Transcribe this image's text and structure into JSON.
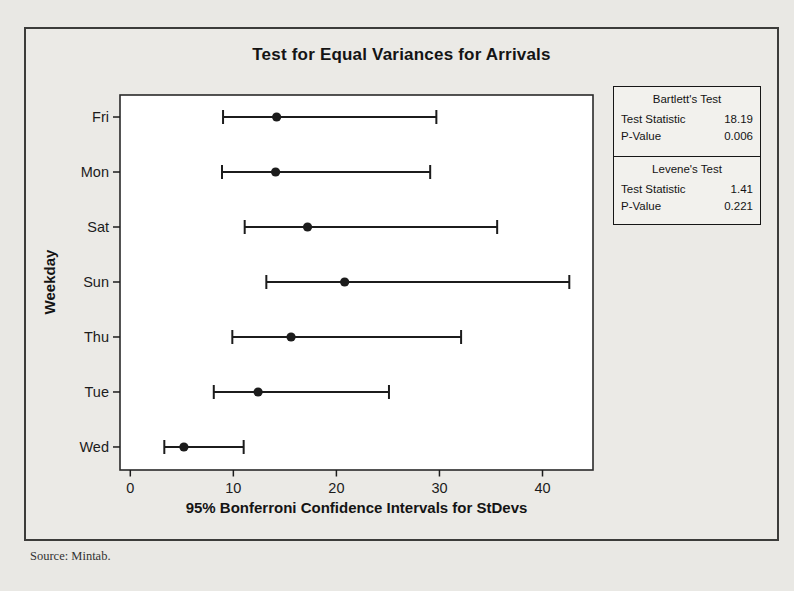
{
  "page": {
    "source_note": "Source: Mintab."
  },
  "chart_data": {
    "type": "scatter",
    "variant": "horizontal-confidence-interval-plot",
    "title": "Test for Equal Variances for Arrivals",
    "xlabel": "95% Bonferroni Confidence Intervals for StDevs",
    "ylabel": "Weekday",
    "categories": [
      "Fri",
      "Mon",
      "Sat",
      "Sun",
      "Thu",
      "Tue",
      "Wed"
    ],
    "series": [
      {
        "name": "95% Bonferroni CI for StDev",
        "points": [
          {
            "category": "Fri",
            "lower": 9.0,
            "stdev": 14.2,
            "upper": 29.7
          },
          {
            "category": "Mon",
            "lower": 8.9,
            "stdev": 14.1,
            "upper": 29.1
          },
          {
            "category": "Sat",
            "lower": 11.1,
            "stdev": 17.2,
            "upper": 35.6
          },
          {
            "category": "Sun",
            "lower": 13.2,
            "stdev": 20.8,
            "upper": 42.6
          },
          {
            "category": "Thu",
            "lower": 9.9,
            "stdev": 15.6,
            "upper": 32.1
          },
          {
            "category": "Tue",
            "lower": 8.1,
            "stdev": 12.4,
            "upper": 25.1
          },
          {
            "category": "Wed",
            "lower": 3.3,
            "stdev": 5.2,
            "upper": 11.0
          }
        ]
      }
    ],
    "xlim": [
      -1.0,
      44.9
    ],
    "xticks": [
      "0",
      "10",
      "20",
      "30",
      "40"
    ],
    "grid": false,
    "legend_position": "none"
  },
  "stats_panel": {
    "sections": [
      {
        "title": "Bartlett's Test",
        "rows": [
          {
            "label": "Test Statistic",
            "value": "18.19"
          },
          {
            "label": "P-Value",
            "value": "0.006"
          }
        ]
      },
      {
        "title": "Levene's Test",
        "rows": [
          {
            "label": "Test Statistic",
            "value": "1.41"
          },
          {
            "label": "P-Value",
            "value": "0.221"
          }
        ]
      }
    ]
  },
  "colors": {
    "page_background": "#e9e8e4",
    "figure_background": "#ebeae6",
    "plot_background": "#ffffff",
    "ink": "#1c1c1c",
    "border": "#3c3c3a"
  }
}
